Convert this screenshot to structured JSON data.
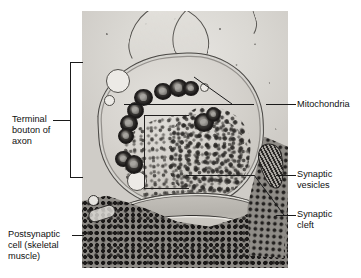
{
  "figure": {
    "type": "electron-micrograph",
    "alt": "Transmission electron micrograph of a neuromuscular junction showing an axon terminal bouton containing mitochondria and synaptic vesicles above a synaptic cleft and postsynaptic skeletal muscle cell"
  },
  "labels": {
    "terminal_bouton": "Terminal\nbouton of\naxon",
    "postsynaptic_cell": "Postsynaptic\ncell (skeletal\nmuscle)",
    "mitochondria": "Mitochondria",
    "synaptic_vesicles": "Synaptic\nvesicles",
    "synaptic_cleft": "Synaptic\ncleft"
  },
  "colors": {
    "background": "#ffffff",
    "text": "#111111",
    "leader_line": "#1a1a1a",
    "micrograph_light": "#dcdad5",
    "micrograph_dark": "#232120"
  }
}
